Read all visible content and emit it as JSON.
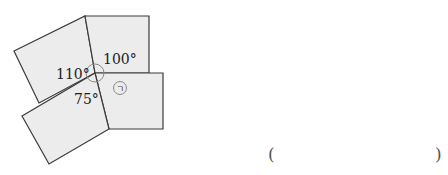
{
  "figure": {
    "angles": [
      {
        "label": "110°",
        "x": 56,
        "y": 79
      },
      {
        "label": "100°",
        "x": 103,
        "y": 64
      },
      {
        "label": "75°",
        "x": 74,
        "y": 104
      }
    ],
    "unknown_marker": "ㄱ",
    "colors": {
      "fill": "#ececec",
      "stroke": "#3a3a3a"
    }
  },
  "answer": {
    "open_paren": "(",
    "close_paren": ")"
  }
}
